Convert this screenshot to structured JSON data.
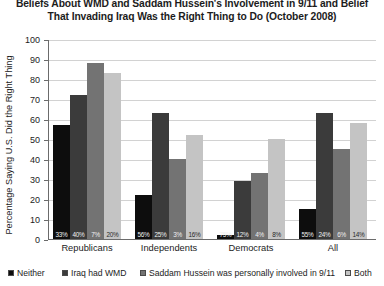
{
  "chart_data": {
    "type": "bar",
    "title_lines": [
      "Beliefs About WMD and Saddam Hussein's Involvement in 9/11 and Belief",
      "That Invading Iraq Was the Right Thing to Do (October 2008)"
    ],
    "title": "Beliefs About WMD and Saddam Hussein's Involvement in 9/11 and Belief That Invading Iraq Was the Right Thing to Do (October 2008)",
    "xlabel": "",
    "ylabel": "Percentage Saying U.S. Did the Right Thing",
    "ylim": [
      0,
      100
    ],
    "ytick_labels": [
      "0",
      "10",
      "20",
      "30",
      "40",
      "50",
      "60",
      "70",
      "80",
      "90",
      "100"
    ],
    "ytick_values": [
      0,
      10,
      20,
      30,
      40,
      50,
      60,
      70,
      80,
      90,
      100
    ],
    "grid": "horizontal",
    "legend_position": "bottom",
    "categories": [
      "Republicans",
      "Independents",
      "Democrats",
      "All"
    ],
    "series": [
      {
        "name": "Neither",
        "color": "#0d0d0d",
        "values": [
          57,
          22,
          2,
          15
        ],
        "share_labels": [
          "33%",
          "56%",
          "75%",
          "55%"
        ]
      },
      {
        "name": "Iraq had WMD",
        "color": "#3b3b3b",
        "values": [
          72,
          63,
          29,
          63
        ],
        "share_labels": [
          "40%",
          "25%",
          "12%",
          "24%"
        ]
      },
      {
        "name": "Saddam Hussein was personally involved in 9/11",
        "color": "#737373",
        "values": [
          88,
          40,
          33,
          45
        ],
        "share_labels": [
          "7%",
          "3%",
          "4%",
          "6%"
        ]
      },
      {
        "name": "Both",
        "color": "#c4c4c4",
        "values": [
          83,
          52,
          50,
          58
        ],
        "share_labels": [
          "20%",
          "16%",
          "8%",
          "14%"
        ]
      }
    ]
  }
}
